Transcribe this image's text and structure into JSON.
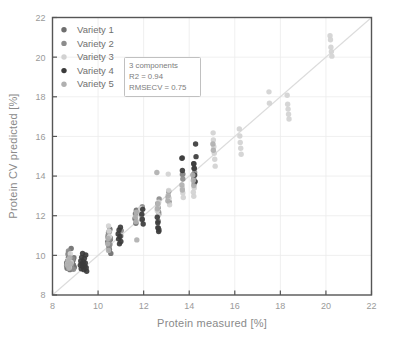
{
  "chart_data": {
    "type": "scatter",
    "title": "",
    "xlabel": "Protein measured [%]",
    "ylabel": "Protein CV predicted [%]",
    "xlim": [
      8,
      22
    ],
    "ylim": [
      8,
      22
    ],
    "xticks": [
      8,
      10,
      12,
      14,
      16,
      18,
      20,
      22
    ],
    "yticks": [
      8,
      10,
      12,
      14,
      16,
      18,
      20,
      22
    ],
    "grid": true,
    "legend_position": "top-left",
    "reference_line": {
      "name": "identity-line",
      "from": [
        8,
        8
      ],
      "to": [
        22,
        22
      ],
      "color": "#dcdcdc"
    },
    "annotation": {
      "components": "3 components",
      "r2": "R2 = 0.94",
      "rmsecv": "RMSECV = 0.75"
    },
    "series": [
      {
        "name": "Variety 1",
        "color": "#6e6e6e",
        "points": [
          [
            8.62,
            9.48
          ],
          [
            8.62,
            9.62
          ],
          [
            8.64,
            9.35
          ],
          [
            8.66,
            9.72
          ],
          [
            8.68,
            9.55
          ],
          [
            8.7,
            9.9
          ],
          [
            8.7,
            10.12
          ],
          [
            8.72,
            9.42
          ],
          [
            8.74,
            9.68
          ],
          [
            8.76,
            9.28
          ],
          [
            8.78,
            9.58
          ],
          [
            8.8,
            9.8
          ],
          [
            8.82,
            10.35
          ],
          [
            8.84,
            9.45
          ],
          [
            8.86,
            9.66
          ],
          [
            8.88,
            9.34
          ],
          [
            8.9,
            9.75
          ],
          [
            8.92,
            9.52
          ],
          [
            8.94,
            9.88
          ],
          [
            8.96,
            9.4
          ],
          [
            10.42,
            10.68
          ],
          [
            10.44,
            10.92
          ],
          [
            10.46,
            11.15
          ],
          [
            10.48,
            10.48
          ],
          [
            10.5,
            10.3
          ],
          [
            10.52,
            11.32
          ],
          [
            10.54,
            10.8
          ],
          [
            10.56,
            10.1
          ],
          [
            11.62,
            11.85
          ],
          [
            11.64,
            12.1
          ],
          [
            11.66,
            11.62
          ],
          [
            11.68,
            12.28
          ],
          [
            12.62,
            11.4
          ],
          [
            12.64,
            11.72
          ],
          [
            12.66,
            12.08
          ],
          [
            12.68,
            11.28
          ],
          [
            13.7,
            14.92
          ],
          [
            13.72,
            14.1
          ],
          [
            14.2,
            14.62
          ],
          [
            14.22,
            14.4
          ]
        ]
      },
      {
        "name": "Variety 2",
        "color": "#8c8c8c",
        "points": [
          [
            8.68,
            10.05
          ],
          [
            8.7,
            10.22
          ],
          [
            8.72,
            9.52
          ],
          [
            8.74,
            9.7
          ],
          [
            8.76,
            9.92
          ],
          [
            8.78,
            9.38
          ],
          [
            8.8,
            9.6
          ],
          [
            8.84,
            9.44
          ],
          [
            8.88,
            9.82
          ],
          [
            8.92,
            9.3
          ],
          [
            10.44,
            11.02
          ],
          [
            10.46,
            10.72
          ],
          [
            10.48,
            10.38
          ],
          [
            10.5,
            11.2
          ],
          [
            10.52,
            10.55
          ],
          [
            10.54,
            10.88
          ],
          [
            11.0,
            10.98
          ],
          [
            11.02,
            11.25
          ],
          [
            11.88,
            12.28
          ],
          [
            11.9,
            12.02
          ],
          [
            11.92,
            11.8
          ],
          [
            11.94,
            12.45
          ],
          [
            12.62,
            12.62
          ],
          [
            12.64,
            12.4
          ],
          [
            12.66,
            12.18
          ],
          [
            12.68,
            12.85
          ],
          [
            13.08,
            12.92
          ],
          [
            13.1,
            13.22
          ],
          [
            13.12,
            12.7
          ],
          [
            13.7,
            14.08
          ],
          [
            13.72,
            13.85
          ],
          [
            14.18,
            14.08
          ],
          [
            14.2,
            13.88
          ],
          [
            14.22,
            13.62
          ],
          [
            14.24,
            14.18
          ]
        ]
      },
      {
        "name": "Variety 3",
        "color": "#d2d2d2",
        "points": [
          [
            8.66,
            9.58
          ],
          [
            8.7,
            9.78
          ],
          [
            8.74,
            9.4
          ],
          [
            8.78,
            10.08
          ],
          [
            8.82,
            9.64
          ],
          [
            10.46,
            11.48
          ],
          [
            10.48,
            11.22
          ],
          [
            10.5,
            10.95
          ],
          [
            11.86,
            12.35
          ],
          [
            11.88,
            12.12
          ],
          [
            11.9,
            11.88
          ],
          [
            12.6,
            12.25
          ],
          [
            12.62,
            12.48
          ],
          [
            12.64,
            12.02
          ],
          [
            12.66,
            12.68
          ],
          [
            13.08,
            14.1
          ],
          [
            13.1,
            13.28
          ],
          [
            13.12,
            12.88
          ],
          [
            13.14,
            12.55
          ],
          [
            13.7,
            13.4
          ],
          [
            13.72,
            13.15
          ],
          [
            13.74,
            12.92
          ],
          [
            14.18,
            13.18
          ],
          [
            14.2,
            12.98
          ],
          [
            14.22,
            13.4
          ],
          [
            15.05,
            16.18
          ],
          [
            15.06,
            15.82
          ],
          [
            15.08,
            15.48
          ],
          [
            15.1,
            15.15
          ],
          [
            15.12,
            14.85
          ],
          [
            15.14,
            14.5
          ],
          [
            16.2,
            16.38
          ],
          [
            16.22,
            16.02
          ],
          [
            16.24,
            15.7
          ],
          [
            16.26,
            15.4
          ],
          [
            16.28,
            15.1
          ],
          [
            17.5,
            18.25
          ],
          [
            17.52,
            17.68
          ],
          [
            18.3,
            18.08
          ],
          [
            18.32,
            17.62
          ],
          [
            18.34,
            17.38
          ],
          [
            18.36,
            17.12
          ],
          [
            18.38,
            16.88
          ],
          [
            20.18,
            21.08
          ],
          [
            20.2,
            20.88
          ],
          [
            20.22,
            20.5
          ],
          [
            20.24,
            20.28
          ],
          [
            20.26,
            20.05
          ]
        ]
      },
      {
        "name": "Variety 4",
        "color": "#3b3b3b",
        "points": [
          [
            9.22,
            9.5
          ],
          [
            9.24,
            9.72
          ],
          [
            9.26,
            9.32
          ],
          [
            9.28,
            9.9
          ],
          [
            9.3,
            9.58
          ],
          [
            9.32,
            10.1
          ],
          [
            9.34,
            9.42
          ],
          [
            9.36,
            9.68
          ],
          [
            9.38,
            9.28
          ],
          [
            9.4,
            9.85
          ],
          [
            9.42,
            9.46
          ],
          [
            9.44,
            9.62
          ],
          [
            9.46,
            10.02
          ],
          [
            9.48,
            9.38
          ],
          [
            9.5,
            9.2
          ],
          [
            10.88,
            11.08
          ],
          [
            10.9,
            10.82
          ],
          [
            10.92,
            11.28
          ],
          [
            10.94,
            10.58
          ],
          [
            10.96,
            10.95
          ],
          [
            10.98,
            11.42
          ],
          [
            11.0,
            10.7
          ],
          [
            11.92,
            12.08
          ],
          [
            11.94,
            11.82
          ],
          [
            11.96,
            12.32
          ],
          [
            11.98,
            11.58
          ],
          [
            12.6,
            11.92
          ],
          [
            12.62,
            11.65
          ],
          [
            12.64,
            11.38
          ],
          [
            12.66,
            11.2
          ],
          [
            13.68,
            14.9
          ],
          [
            13.7,
            14.28
          ],
          [
            14.2,
            14.62
          ],
          [
            14.22,
            14.38
          ],
          [
            14.24,
            14.05
          ],
          [
            14.26,
            13.72
          ],
          [
            14.28,
            15.62
          ],
          [
            14.3,
            14.98
          ]
        ]
      },
      {
        "name": "Variety 5",
        "color": "#b0b0b0",
        "points": [
          [
            8.64,
            9.5
          ],
          [
            8.68,
            9.72
          ],
          [
            8.72,
            9.35
          ],
          [
            8.76,
            9.88
          ],
          [
            8.8,
            9.58
          ],
          [
            10.42,
            10.58
          ],
          [
            10.44,
            10.85
          ],
          [
            10.46,
            10.25
          ],
          [
            11.64,
            11.95
          ],
          [
            11.66,
            11.7
          ],
          [
            11.68,
            12.18
          ],
          [
            11.7,
            10.78
          ],
          [
            12.58,
            14.18
          ],
          [
            12.6,
            12.35
          ],
          [
            12.62,
            12.6
          ],
          [
            13.06,
            12.75
          ],
          [
            13.08,
            13.02
          ],
          [
            13.68,
            13.55
          ],
          [
            13.7,
            13.3
          ],
          [
            14.16,
            14.05
          ],
          [
            14.18,
            13.78
          ],
          [
            14.2,
            13.52
          ],
          [
            15.04,
            15.62
          ],
          [
            15.06,
            15.3
          ]
        ]
      }
    ]
  },
  "legend": {
    "items": [
      {
        "label": "Variety 1",
        "color": "#6e6e6e"
      },
      {
        "label": "Variety 2",
        "color": "#8c8c8c"
      },
      {
        "label": "Variety 3",
        "color": "#d2d2d2"
      },
      {
        "label": "Variety 4",
        "color": "#3b3b3b"
      },
      {
        "label": "Variety 5",
        "color": "#b0b0b0"
      }
    ]
  }
}
